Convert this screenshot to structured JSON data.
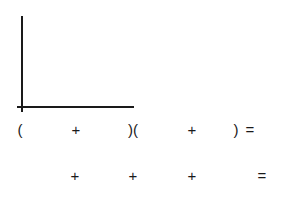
{
  "graph": {
    "axes": "empty L-shaped coordinate axes"
  },
  "equation_row_1": {
    "tokens": [
      {
        "text": "(",
        "x": 20,
        "y": 121
      },
      {
        "text": "+",
        "x": 76,
        "y": 121
      },
      {
        "text": ")(",
        "x": 133,
        "y": 121
      },
      {
        "text": "+",
        "x": 192,
        "y": 121
      },
      {
        "text": ")",
        "x": 236,
        "y": 121
      },
      {
        "text": "=",
        "x": 250,
        "y": 121
      }
    ]
  },
  "equation_row_2": {
    "tokens": [
      {
        "text": "+",
        "x": 75,
        "y": 167
      },
      {
        "text": "+",
        "x": 133,
        "y": 167
      },
      {
        "text": "+",
        "x": 192,
        "y": 167
      },
      {
        "text": "=",
        "x": 262,
        "y": 167
      }
    ]
  }
}
